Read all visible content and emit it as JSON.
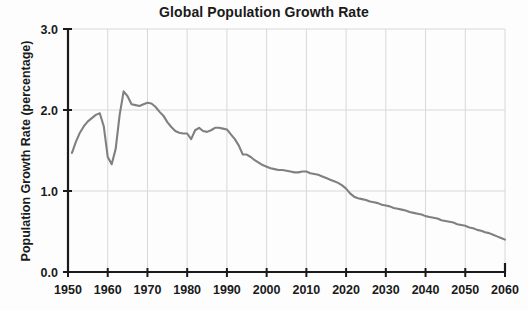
{
  "chart_data": {
    "type": "line",
    "title": "Global Population Growth Rate",
    "xlabel": "",
    "ylabel": "Population Growth Rate (percentage)",
    "xlim": [
      1950,
      2060
    ],
    "ylim": [
      0.0,
      3.0
    ],
    "grid": true,
    "legend": "none",
    "line_color": "#808080",
    "axis_color": "#1a1a1a",
    "grid_color": "#d8d8d8",
    "x_ticks": [
      1950,
      1960,
      1970,
      1980,
      1990,
      2000,
      2010,
      2020,
      2030,
      2040,
      2050,
      2060
    ],
    "x_tick_labels": [
      "1950",
      "1960",
      "1970",
      "1980",
      "1990",
      "2000",
      "2010",
      "2020",
      "2030",
      "2040",
      "2050",
      "2060"
    ],
    "y_ticks": [
      0.0,
      1.0,
      2.0,
      3.0
    ],
    "y_tick_labels": [
      "0.0",
      "1.0",
      "2.0",
      "3.0"
    ],
    "series": [
      {
        "name": "Global population growth rate",
        "x": [
          1951,
          1952,
          1953,
          1954,
          1955,
          1956,
          1957,
          1958,
          1959,
          1960,
          1961,
          1962,
          1963,
          1964,
          1965,
          1966,
          1967,
          1968,
          1969,
          1970,
          1971,
          1972,
          1973,
          1974,
          1975,
          1976,
          1977,
          1978,
          1979,
          1980,
          1981,
          1982,
          1983,
          1984,
          1985,
          1986,
          1987,
          1988,
          1989,
          1990,
          1991,
          1992,
          1993,
          1994,
          1995,
          1996,
          1997,
          1998,
          1999,
          2000,
          2001,
          2002,
          2003,
          2004,
          2005,
          2006,
          2007,
          2008,
          2009,
          2010,
          2011,
          2012,
          2013,
          2014,
          2015,
          2016,
          2017,
          2018,
          2019,
          2020,
          2021,
          2022,
          2023,
          2024,
          2025,
          2026,
          2027,
          2028,
          2029,
          2030,
          2031,
          2032,
          2033,
          2034,
          2035,
          2036,
          2037,
          2038,
          2039,
          2040,
          2041,
          2042,
          2043,
          2044,
          2045,
          2046,
          2047,
          2048,
          2049,
          2050,
          2051,
          2052,
          2053,
          2054,
          2055,
          2056,
          2057,
          2058,
          2059,
          2060
        ],
        "y": [
          1.47,
          1.61,
          1.72,
          1.8,
          1.86,
          1.9,
          1.94,
          1.96,
          1.8,
          1.42,
          1.33,
          1.52,
          1.94,
          2.23,
          2.17,
          2.07,
          2.06,
          2.05,
          2.07,
          2.09,
          2.08,
          2.04,
          1.98,
          1.93,
          1.85,
          1.79,
          1.74,
          1.72,
          1.71,
          1.71,
          1.64,
          1.75,
          1.78,
          1.74,
          1.73,
          1.75,
          1.78,
          1.78,
          1.77,
          1.76,
          1.7,
          1.64,
          1.56,
          1.45,
          1.45,
          1.42,
          1.38,
          1.35,
          1.32,
          1.3,
          1.28,
          1.27,
          1.26,
          1.26,
          1.25,
          1.24,
          1.23,
          1.23,
          1.24,
          1.24,
          1.22,
          1.21,
          1.2,
          1.18,
          1.16,
          1.14,
          1.12,
          1.1,
          1.07,
          1.03,
          0.97,
          0.93,
          0.91,
          0.9,
          0.89,
          0.87,
          0.86,
          0.85,
          0.83,
          0.82,
          0.81,
          0.79,
          0.78,
          0.77,
          0.76,
          0.74,
          0.73,
          0.72,
          0.71,
          0.69,
          0.68,
          0.67,
          0.66,
          0.64,
          0.63,
          0.62,
          0.61,
          0.59,
          0.58,
          0.57,
          0.55,
          0.54,
          0.52,
          0.51,
          0.49,
          0.48,
          0.46,
          0.44,
          0.42,
          0.4
        ]
      }
    ]
  }
}
